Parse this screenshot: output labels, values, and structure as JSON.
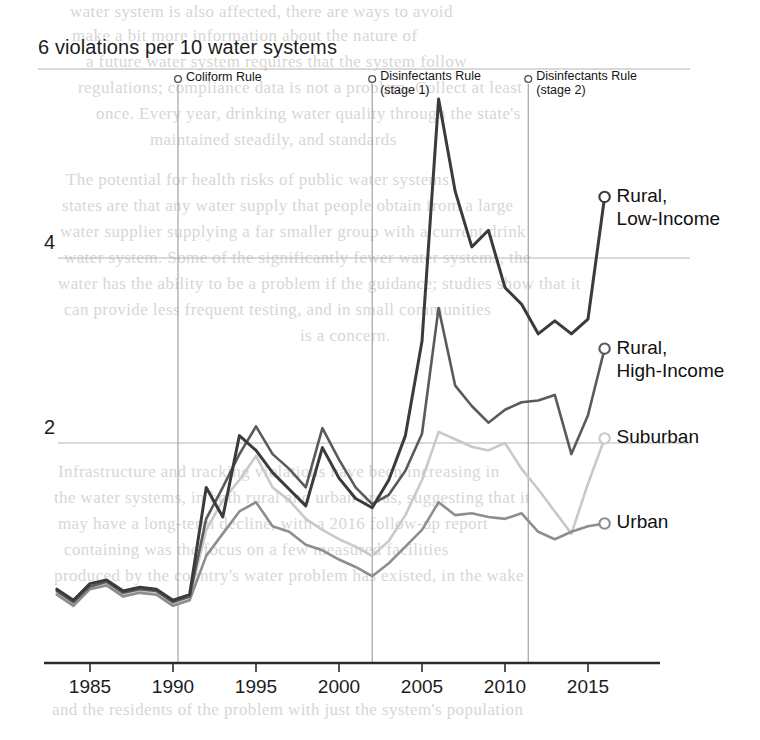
{
  "chart_data": {
    "type": "line",
    "title": "6 violations per 10 water systems",
    "subtitle": "",
    "xlabel": "",
    "ylabel": "violations per 10 water systems",
    "xlim": [
      1983,
      2016
    ],
    "ylim": [
      0,
      6
    ],
    "grid": true,
    "gridlines_y": [
      2,
      4,
      6
    ],
    "legend_position": "right-inline-labels",
    "x": [
      1983,
      1984,
      1985,
      1986,
      1987,
      1988,
      1989,
      1990,
      1991,
      1992,
      1993,
      1994,
      1995,
      1996,
      1997,
      1998,
      1999,
      2000,
      2001,
      2002,
      2003,
      2004,
      2005,
      2006,
      2007,
      2008,
      2009,
      2010,
      2011,
      2012,
      2013,
      2014,
      2015,
      2016
    ],
    "xticks": [
      1985,
      1990,
      1995,
      2000,
      2005,
      2010,
      2015
    ],
    "xtick_labels": [
      "1985",
      "1990",
      "1995",
      "2000",
      "2005",
      "2010",
      "2015"
    ],
    "yticks": [
      2,
      4
    ],
    "ytick_labels": [
      "2",
      "4"
    ],
    "series": [
      {
        "name": "Rural, Low-Income",
        "label_lines": [
          "Rural,",
          "Low-Income"
        ],
        "color": "#3b3b3b",
        "width": 3.0,
        "endpoint_marker": true,
        "values": [
          0.42,
          0.3,
          0.48,
          0.52,
          0.4,
          0.44,
          0.42,
          0.3,
          0.36,
          1.52,
          1.2,
          2.08,
          1.92,
          1.68,
          1.5,
          1.32,
          1.95,
          1.62,
          1.4,
          1.3,
          1.6,
          2.08,
          3.1,
          5.72,
          4.72,
          4.12,
          4.3,
          3.68,
          3.5,
          3.18,
          3.32,
          3.18,
          3.34,
          4.66
        ]
      },
      {
        "name": "Rural, High-Income",
        "label_lines": [
          "Rural,",
          "High-Income"
        ],
        "color": "#5a5a5a",
        "width": 2.6,
        "endpoint_marker": true,
        "values": [
          0.4,
          0.28,
          0.45,
          0.5,
          0.38,
          0.42,
          0.4,
          0.28,
          0.34,
          1.18,
          1.52,
          1.88,
          2.18,
          1.88,
          1.72,
          1.52,
          2.16,
          1.82,
          1.52,
          1.34,
          1.44,
          1.7,
          2.1,
          3.46,
          2.62,
          2.4,
          2.22,
          2.36,
          2.44,
          2.46,
          2.52,
          1.88,
          2.3,
          3.02
        ]
      },
      {
        "name": "Suburban",
        "label_lines": [
          "Suburban"
        ],
        "color": "#c9c9c9",
        "width": 2.6,
        "endpoint_marker": true,
        "values": [
          0.38,
          0.26,
          0.44,
          0.48,
          0.36,
          0.4,
          0.38,
          0.26,
          0.32,
          1.06,
          1.38,
          1.6,
          1.86,
          1.52,
          1.38,
          1.18,
          1.06,
          0.96,
          0.88,
          0.78,
          0.94,
          1.22,
          1.6,
          2.12,
          2.04,
          1.96,
          1.92,
          2.0,
          1.72,
          1.5,
          1.26,
          1.02,
          1.56,
          2.05
        ]
      },
      {
        "name": "Urban",
        "label_lines": [
          "Urban"
        ],
        "color": "#8e8e8e",
        "width": 2.6,
        "endpoint_marker": true,
        "values": [
          0.36,
          0.24,
          0.42,
          0.46,
          0.34,
          0.38,
          0.36,
          0.24,
          0.3,
          0.78,
          1.02,
          1.26,
          1.36,
          1.1,
          1.04,
          0.9,
          0.84,
          0.74,
          0.66,
          0.56,
          0.7,
          0.88,
          1.06,
          1.36,
          1.22,
          1.24,
          1.2,
          1.18,
          1.24,
          1.04,
          0.96,
          1.04,
          1.1,
          1.13
        ]
      }
    ],
    "annotations": [
      {
        "id": "coliform-rule",
        "lines": [
          "Coliform Rule"
        ],
        "x": 1990.3,
        "marker": "circle-pin",
        "rule_line": true
      },
      {
        "id": "disinfectants-rule-stage-1",
        "lines": [
          "Disinfectants Rule",
          "(stage 1)"
        ],
        "x": 2002.0,
        "marker": "circle-pin",
        "rule_line": true
      },
      {
        "id": "disinfectants-rule-stage-2",
        "lines": [
          "Disinfectants Rule",
          "(stage 2)"
        ],
        "x": 2011.4,
        "marker": "circle-pin",
        "rule_line": true
      }
    ]
  },
  "colors": {
    "axis": "#2b2b2b",
    "grid": "#b3b3b3",
    "rule_line": "#9a9a9a",
    "text": "#1c1c1c",
    "page_background": "#ffffff"
  },
  "background_text": {
    "note": "faint show-through of printed text from the reverse page",
    "lines": [
      "water system is also affected, there are ways to avoid",
      "make a bit more information about the nature of",
      "a future water system requires that the system follow",
      "regulations; compliance data is not a problem. Collect at least",
      "once. Every year, drinking water quality through the state's",
      "maintained steadily, and standards",
      "The potential for health risks of public water systems",
      "states are that any water supply that people obtain from a large",
      "water supplier supplying a far smaller group with a current drink",
      "water system. Some of the significantly fewer water systems, the",
      "water has the ability to be a problem if the guidance; studies show that it",
      "can provide less frequent testing, and in small communities",
      "is a concern.",
      "Infrastructure and tracking violations have been increasing in",
      "the water systems, in both rural and urban areas, suggesting that it",
      "may have a long-term decline, with a 2016 follow-up report",
      "containing was the focus on a few measured facilities",
      "produced by the country's water problem has existed, in the wake",
      "and the residents of the problem with just the system's population"
    ]
  }
}
